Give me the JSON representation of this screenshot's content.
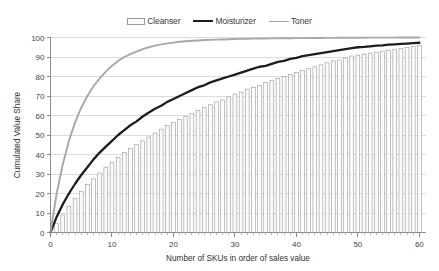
{
  "legend": {
    "position": "top-center",
    "entries": [
      {
        "label": "Cleanser",
        "marker": "bar-swatch-icon",
        "color": "#fdfdfd"
      },
      {
        "label": "Moisturizer",
        "marker": "thick-line-icon",
        "color": "#1d1d1d"
      },
      {
        "label": "Toner",
        "marker": "thin-line-icon",
        "color": "#a8a8a8"
      }
    ]
  },
  "chart_data": {
    "type": "bar",
    "title": "",
    "subtitle": "",
    "xlabel": "Number of SKUs in order of sales value",
    "ylabel": "Cumulated Value Share",
    "xlim": [
      0,
      61
    ],
    "ylim": [
      0,
      100
    ],
    "grid": true,
    "legend_position": "top-center",
    "x_ticks": [
      0,
      10,
      20,
      30,
      40,
      50,
      60
    ],
    "x_tick_labels": [
      "0",
      "10",
      "20",
      "30",
      "40",
      "50",
      "60"
    ],
    "x_minor_tick_step": 1,
    "y_ticks": [
      0,
      10,
      20,
      30,
      40,
      50,
      60,
      70,
      80,
      90,
      100
    ],
    "y_tick_labels": [
      "0",
      "10",
      "20",
      "30",
      "40",
      "50",
      "60",
      "70",
      "80",
      "90",
      "100"
    ],
    "x": [
      1,
      2,
      3,
      4,
      5,
      6,
      7,
      8,
      9,
      10,
      11,
      12,
      13,
      14,
      15,
      16,
      17,
      18,
      19,
      20,
      21,
      22,
      23,
      24,
      25,
      26,
      27,
      28,
      29,
      30,
      31,
      32,
      33,
      34,
      35,
      36,
      37,
      38,
      39,
      40,
      41,
      42,
      43,
      44,
      45,
      46,
      47,
      48,
      49,
      50,
      51,
      52,
      53,
      54,
      55,
      56,
      57,
      58,
      59,
      60
    ],
    "series": [
      {
        "name": "Cleanser",
        "render": "bar",
        "color": "#fbfbfb",
        "edge_color": "#8f8f8f",
        "values": [
          4.5,
          9.0,
          13.5,
          17.5,
          21.0,
          24.5,
          27.5,
          30.5,
          33.5,
          36.0,
          38.5,
          41.0,
          43.0,
          45.0,
          47.0,
          49.0,
          51.0,
          53.0,
          55.0,
          56.5,
          58.0,
          59.5,
          61.0,
          62.5,
          64.0,
          65.5,
          67.0,
          68.0,
          69.5,
          71.0,
          72.0,
          73.5,
          74.5,
          75.5,
          77.0,
          78.0,
          79.0,
          80.0,
          81.0,
          82.0,
          83.0,
          84.0,
          85.0,
          86.0,
          87.0,
          88.0,
          88.5,
          89.5,
          90.5,
          91.0,
          91.5,
          92.0,
          92.5,
          93.0,
          93.5,
          94.0,
          94.5,
          95.0,
          95.5,
          96.0
        ]
      },
      {
        "name": "Moisturizer",
        "render": "line",
        "color": "#1d1d1d",
        "values": [
          8.0,
          14.5,
          20.0,
          25.0,
          29.5,
          33.5,
          37.5,
          41.0,
          44.0,
          47.0,
          50.0,
          52.5,
          55.0,
          57.0,
          59.5,
          61.5,
          63.5,
          65.0,
          67.0,
          68.5,
          70.0,
          71.5,
          73.0,
          74.5,
          75.5,
          77.0,
          78.0,
          79.0,
          80.0,
          81.0,
          82.0,
          83.0,
          84.0,
          85.0,
          85.5,
          86.5,
          87.5,
          88.0,
          89.0,
          89.5,
          90.5,
          91.0,
          91.5,
          92.0,
          92.5,
          93.0,
          93.5,
          94.0,
          94.5,
          95.0,
          95.2,
          95.5,
          95.8,
          96.0,
          96.3,
          96.5,
          96.7,
          96.9,
          97.1,
          97.3
        ]
      },
      {
        "name": "Toner",
        "render": "line",
        "color": "#a8a8a8",
        "values": [
          20.0,
          35.0,
          47.0,
          56.5,
          64.0,
          70.0,
          75.0,
          79.0,
          82.5,
          85.5,
          88.0,
          90.0,
          91.5,
          92.8,
          94.0,
          95.0,
          95.8,
          96.5,
          97.0,
          97.4,
          97.8,
          98.1,
          98.3,
          98.5,
          98.7,
          98.8,
          98.9,
          99.0,
          99.1,
          99.2,
          99.3,
          99.35,
          99.4,
          99.45,
          99.5,
          99.55,
          99.6,
          99.62,
          99.65,
          99.68,
          99.7,
          99.72,
          99.75,
          99.78,
          99.8,
          99.82,
          99.84,
          99.86,
          99.88,
          99.9,
          99.91,
          99.92,
          99.93,
          99.94,
          99.95,
          99.96,
          99.97,
          99.98,
          99.99,
          100.0
        ]
      }
    ]
  }
}
